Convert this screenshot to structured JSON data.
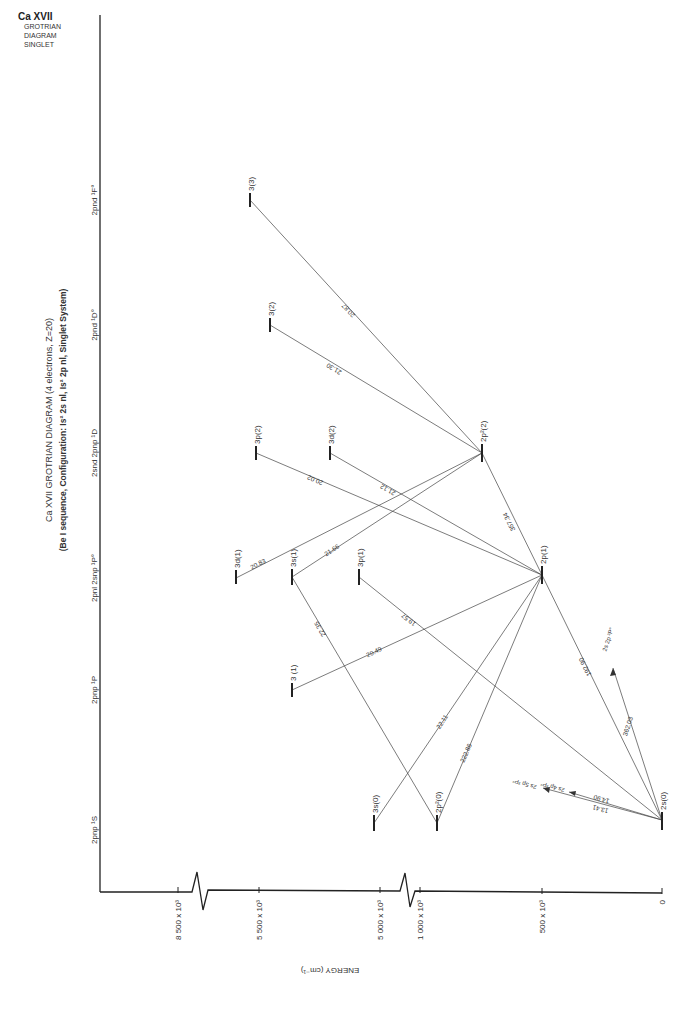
{
  "corner": {
    "ion": "Ca XVII",
    "lines": [
      "GROTRIAN",
      "DIAGRAM",
      "SINGLET"
    ]
  },
  "title": {
    "line1": "Ca XVII  GROTRIAN  DIAGRAM  (4 electrons, Z=20)",
    "line2": "(Be I sequence, Configuration: Is² 2s nl, Is² 2p nl, Singlet System)"
  },
  "columns": [
    {
      "label": "2pnp ¹S",
      "prefix": "2pnp 2sns"
    },
    {
      "label": "2pnp ¹P"
    },
    {
      "label": "2pnl 2snp ¹P°"
    },
    {
      "label": "2snd 2pnp ¹D"
    },
    {
      "label": "2pnd ¹D°"
    },
    {
      "label": "2pnd ¹F°"
    }
  ],
  "axis": {
    "title": "ENERGY (cm⁻¹)",
    "ticks": [
      "0",
      "500 x 10³",
      "1 000 x 10³",
      "5 000 x 10³",
      "5 500 x 10³",
      "8 500 x 10³"
    ]
  },
  "levels": [
    {
      "id": "2s0",
      "label": "2s(0)"
    },
    {
      "id": "2p1",
      "label": "2p(1)"
    },
    {
      "id": "2p2_2",
      "label": "2p²(2)"
    },
    {
      "id": "3s0",
      "label": "3s(0)"
    },
    {
      "id": "2p2_0",
      "label": "2p²(0)"
    },
    {
      "id": "3_1",
      "label": "3 (1)"
    },
    {
      "id": "3d1",
      "label": "3d(1)"
    },
    {
      "id": "3s1",
      "label": "3s(1)"
    },
    {
      "id": "3p1",
      "label": "3p(1)"
    },
    {
      "id": "3p2",
      "label": "3p(2)"
    },
    {
      "id": "3d2",
      "label": "3d(2)"
    },
    {
      "id": "3_2",
      "label": "3(2)"
    },
    {
      "id": "3_3",
      "label": "3(3)"
    }
  ],
  "transitions": [
    {
      "from": "3(3)",
      "to": "2p²(2)",
      "wavelength": "20.87"
    },
    {
      "from": "3(2)",
      "to": "2p²(2)",
      "wavelength": "21.30"
    },
    {
      "from": "3p(2)",
      "to": "2p(1)",
      "wavelength": "20.02"
    },
    {
      "from": "3d(2)",
      "to": "2p(1)",
      "wavelength": "21.12"
    },
    {
      "from": "3d(1)",
      "to": "2p²(2)",
      "wavelength": "20.83"
    },
    {
      "from": "3s(1)",
      "to": "2p²(2)",
      "wavelength": "21.66"
    },
    {
      "from": "3s(1)",
      "to": "2p²(0)",
      "wavelength": "22.35"
    },
    {
      "from": "3p(1)",
      "to": "2s(0)",
      "wavelength": "19.57"
    },
    {
      "from": "3 (1)",
      "to": "2p(1)",
      "wavelength": "20.49"
    },
    {
      "from": "3s(0)",
      "to": "2p(1)",
      "wavelength": "22.11"
    },
    {
      "from": "2p²(0)",
      "to": "2p(1)",
      "wavelength": "222.86"
    },
    {
      "from": "2p²(2)",
      "to": "2p(1)",
      "wavelength": "357.34"
    },
    {
      "from": "2p(1)",
      "to": "2s(0)",
      "wavelength": "192.90"
    },
    {
      "from": "2s(0)",
      "to": "2s 2p ³P°",
      "wavelength": "362.03"
    },
    {
      "from": "2s(0)",
      "to": "2s 4p ³P°",
      "wavelength": "14.90"
    },
    {
      "from": "2s(0)",
      "to": "2s 5p ³P°",
      "wavelength": "13.41"
    }
  ],
  "arrow_targets": [
    "2s 2p ³P°",
    "2s 4p ³P°",
    "2s 5p ³P°"
  ]
}
